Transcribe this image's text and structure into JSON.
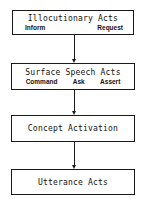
{
  "diagram": {
    "nodes": [
      {
        "title": "Illocutionary Acts",
        "subitems": [
          "Inform",
          "Request"
        ]
      },
      {
        "title": "Surface Speech Acts",
        "subitems": [
          "Command",
          "Ask",
          "Assert"
        ]
      },
      {
        "title": "Concept Activation",
        "subitems": []
      },
      {
        "title": "Utterance Acts",
        "subitems": []
      }
    ],
    "edges": [
      {
        "from": "Illocutionary Acts",
        "to": "Surface Speech Acts"
      },
      {
        "from": "Surface Speech Acts",
        "to": "Concept Activation"
      },
      {
        "from": "Concept Activation",
        "to": "Utterance Acts"
      }
    ],
    "colors": {
      "line": "#1a1a1a",
      "text": "#111111",
      "background": "#ffffff"
    }
  }
}
